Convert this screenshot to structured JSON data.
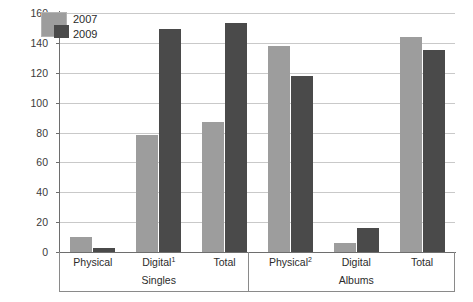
{
  "chart_data": {
    "type": "bar",
    "title": "",
    "xlabel": "",
    "ylabel": "",
    "ylim": [
      0,
      160
    ],
    "yticks": [
      0,
      20,
      40,
      60,
      80,
      100,
      120,
      140,
      160
    ],
    "grid": true,
    "legend_position": "top-left",
    "categories": [
      "Physical",
      "Digital¹",
      "Total",
      "Physical²",
      "Digital",
      "Total"
    ],
    "groups": [
      {
        "name": "Singles",
        "categories": [
          "Physical",
          "Digital¹",
          "Total"
        ]
      },
      {
        "name": "Albums",
        "categories": [
          "Physical²",
          "Digital",
          "Total"
        ]
      }
    ],
    "series": [
      {
        "name": "2007",
        "color": "#9d9d9d",
        "values": [
          10,
          78,
          87,
          138,
          6,
          144
        ]
      },
      {
        "name": "2009",
        "color": "#4a4a4a",
        "values": [
          3,
          149,
          153,
          118,
          16,
          135
        ]
      }
    ]
  },
  "legend": {
    "entries": [
      {
        "label": "2007",
        "color": "#9d9d9d"
      },
      {
        "label": "2009",
        "color": "#4a4a4a"
      }
    ]
  },
  "axis": {
    "y_tick_labels": [
      "160",
      "140",
      "120",
      "100",
      "80",
      "60",
      "40",
      "20",
      "0"
    ]
  },
  "colors": {
    "series_2007": "#9d9d9d",
    "series_2009": "#4a4a4a",
    "gridline": "#c9c9c9",
    "axis": "#6e6e6e",
    "background": "#ffffff"
  }
}
